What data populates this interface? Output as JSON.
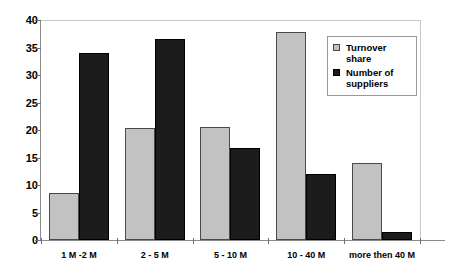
{
  "chart_data": {
    "type": "bar",
    "title": "",
    "subtitle": "",
    "xlabel": "",
    "ylabel": "",
    "categories": [
      "1 M -2 M",
      "2 - 5 M",
      "5 - 10 M",
      "10 - 40 M",
      "more then 40 M"
    ],
    "series": [
      {
        "name": "Turnover share",
        "color": "#c2c2c2",
        "values": [
          8.5,
          20.3,
          20.5,
          37.8,
          14.0
        ]
      },
      {
        "name": "Number of suppliers",
        "color": "#1c1c1c",
        "values": [
          34.0,
          36.5,
          16.7,
          12.0,
          1.5
        ]
      }
    ],
    "ylim": [
      0,
      40
    ],
    "ytick_labels": [
      "40",
      "35",
      "30",
      "25",
      "20",
      "15",
      "10",
      "5",
      "0"
    ],
    "ytick_values": [
      40,
      35,
      30,
      25,
      20,
      15,
      10,
      5,
      0
    ],
    "grid": false,
    "legend_position": "top-right"
  },
  "legend": {
    "entries": [
      {
        "label": "Turnover share"
      },
      {
        "label": "Number of suppliers"
      }
    ]
  }
}
